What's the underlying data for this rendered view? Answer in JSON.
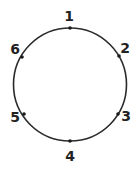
{
  "diagram": {
    "type": "circle-with-numbered-points",
    "circle": {
      "cx": 70,
      "cy": 84.5,
      "r": 56.5,
      "stroke": "#2a2a2a",
      "stroke_width": 1.6
    },
    "points": [
      {
        "label": "1",
        "x": 70,
        "y": 28,
        "lx": 69,
        "ly": 21
      },
      {
        "label": "2",
        "x": 119,
        "y": 56,
        "lx": 125,
        "ly": 53
      },
      {
        "label": "3",
        "x": 118,
        "y": 114,
        "lx": 126,
        "ly": 121
      },
      {
        "label": "4",
        "x": 70,
        "y": 141,
        "lx": 70,
        "ly": 161
      },
      {
        "label": "5",
        "x": 24,
        "y": 114,
        "lx": 15,
        "ly": 122
      },
      {
        "label": "6",
        "x": 22,
        "y": 57,
        "lx": 15,
        "ly": 54
      }
    ],
    "point_color": "#1a1a1a",
    "point_radius": 1.8
  }
}
